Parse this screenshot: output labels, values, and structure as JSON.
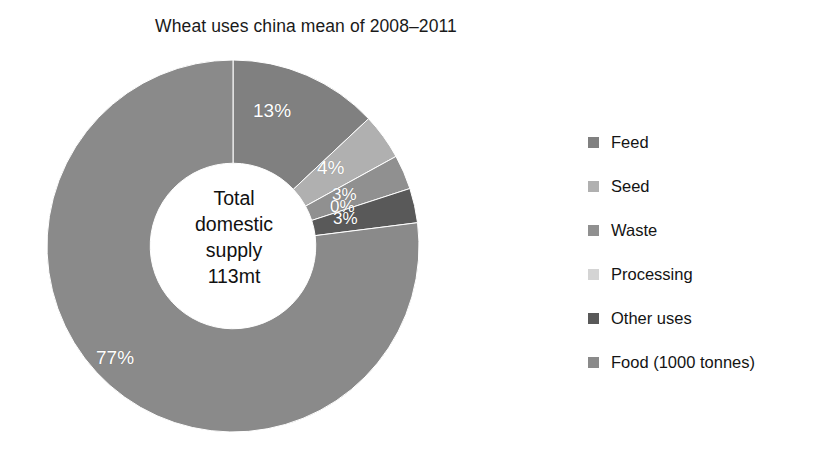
{
  "chart_data": {
    "type": "pie",
    "variant": "donut",
    "title": "Wheat uses china mean of 2008–2011",
    "categories": [
      "Feed",
      "Seed",
      "Waste",
      "Processing",
      "Other uses",
      "Food (1000 tonnes)"
    ],
    "values": [
      13,
      4,
      3,
      0,
      3,
      77
    ],
    "value_labels": [
      "13%",
      "4%",
      "3%",
      "0%",
      "3%",
      "77%"
    ],
    "unit": "percent of total domestic supply",
    "colors": [
      "#808080",
      "#b0b0b0",
      "#909090",
      "#d4d4d4",
      "#595959",
      "#8a8a8a"
    ],
    "start_angle_deg": 0,
    "direction": "clockwise",
    "inner_radius_ratio": 0.445,
    "legend_position": "right",
    "grid": false,
    "xlabel": "",
    "ylabel": "",
    "center_annotation": {
      "line1": "Total",
      "line2": "domestic",
      "line3": "supply",
      "line4": "113mt"
    }
  },
  "legend": {
    "items": [
      {
        "label": "Feed",
        "color": "#808080"
      },
      {
        "label": "Seed",
        "color": "#b0b0b0"
      },
      {
        "label": "Waste",
        "color": "#909090"
      },
      {
        "label": "Processing",
        "color": "#d4d4d4"
      },
      {
        "label": "Other uses",
        "color": "#595959"
      },
      {
        "label": "Food (1000 tonnes)",
        "color": "#8a8a8a"
      }
    ]
  }
}
